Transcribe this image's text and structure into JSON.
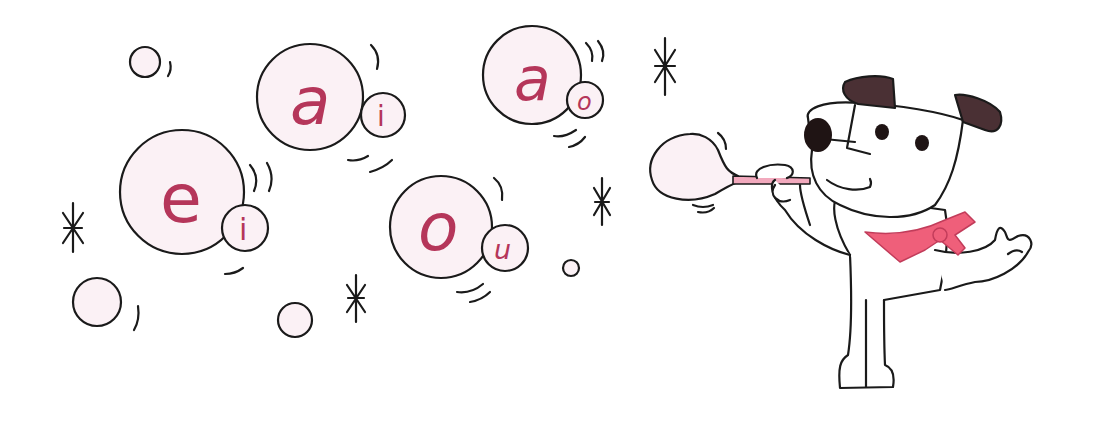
{
  "illustration": {
    "subject": "dog blowing bubbles with vowel letters",
    "colors": {
      "outline": "#1a1a1a",
      "bubble_fill": "#fbf1f5",
      "letter": "#b5365a",
      "scarf": "#ef5f7a",
      "ears": "#4a3034",
      "nose": "#1f1414"
    },
    "bubbles": [
      {
        "big_letter": "e",
        "small_letter": "i"
      },
      {
        "big_letter": "a",
        "small_letter": "i"
      },
      {
        "big_letter": "a",
        "small_letter": "o"
      },
      {
        "big_letter": "o",
        "small_letter": "u"
      }
    ]
  }
}
